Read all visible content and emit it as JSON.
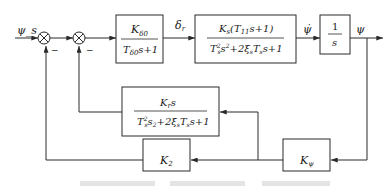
{
  "diagram": {
    "type": "block-diagram",
    "signals": {
      "input": "ψ_s",
      "delta": "δ_r",
      "rate": "ψ̇",
      "output": "ψ"
    },
    "summing_junctions": [
      {
        "id": "sum1",
        "sign_label": "−"
      },
      {
        "id": "sum2",
        "sign_label": "−"
      }
    ],
    "blocks": {
      "actuator": {
        "num": "K",
        "num_sub": "δ0",
        "den_a": "T",
        "den_sub": "δ0",
        "den_b": "s+1"
      },
      "ship": {
        "num": "K",
        "num_sub": "s",
        "num_rest": "(T",
        "num_sub2": "11",
        "num_end": "s+1)",
        "den": "T²ₛs²+2ξₛTₛs+1"
      },
      "integrator": {
        "num": "1",
        "den": "s"
      },
      "rate_feedback": {
        "num": "K",
        "num_sub": "r",
        "num_end": "s",
        "den": "T²ₛs₂+2ξₛTₛs+1"
      },
      "k2": {
        "label": "K",
        "sub": "2"
      },
      "kpsi": {
        "label": "K",
        "sub": "ψ"
      }
    },
    "caption_visible": false
  }
}
